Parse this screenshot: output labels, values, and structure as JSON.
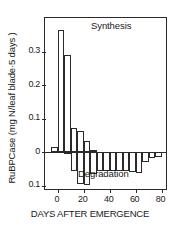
{
  "figure": {
    "background_color": "#ffffff",
    "line_color": "#2a2a2a"
  },
  "axes": {
    "ylabel": "RuBPCase (mg N/leaf blade·5 days )",
    "xlabel": "DAYS AFTER EMERGENCE",
    "ytick_labels": [
      "0.3",
      "0.2",
      "0.1",
      "0",
      "0.1"
    ],
    "ytick_values": [
      0.3,
      0.2,
      0.1,
      0,
      -0.1
    ],
    "xtick_labels": [
      "0",
      "20",
      "40",
      "60",
      "80"
    ],
    "xtick_values": [
      0,
      20,
      40,
      60,
      80
    ]
  },
  "annotations": {
    "synthesis": "Synthesis",
    "degradation": "Degradation"
  },
  "chart_data": {
    "type": "bar",
    "title": "",
    "subtitle": "",
    "xlabel": "DAYS AFTER EMERGENCE",
    "ylabel": "RuBPCase (mg N/leaf blade·5 days )",
    "xlim": [
      -10,
      85
    ],
    "ylim": [
      -0.115,
      0.4
    ],
    "grid": false,
    "legend": "none",
    "bin_width": 5,
    "zero_line": 0,
    "annotations": [
      {
        "text": "Synthesis",
        "x": 28,
        "y": 0.375
      },
      {
        "text": "Degradation",
        "x": 28,
        "y": -0.105
      }
    ],
    "series": [
      {
        "name": "Synthesis",
        "bin_starts": [
          -10,
          -5,
          0,
          5,
          10,
          15,
          20,
          25,
          30,
          35,
          40,
          45,
          50,
          55,
          60,
          65,
          70,
          75,
          80
        ],
        "values": [
          0.0,
          0.015,
          0.365,
          0.29,
          0.072,
          0.063,
          0.035,
          0.008,
          0.0,
          0.0,
          0.0,
          0.0,
          0.0,
          0.0,
          0.0,
          0.0,
          0.0,
          0.0,
          0.0
        ]
      },
      {
        "name": "Degradation",
        "bin_starts": [
          -10,
          -5,
          0,
          5,
          10,
          15,
          20,
          25,
          30,
          35,
          40,
          45,
          50,
          55,
          60,
          65,
          70,
          75,
          80
        ],
        "values": [
          0.0,
          0.0,
          0.0,
          -0.006,
          -0.055,
          -0.095,
          -0.097,
          -0.065,
          -0.055,
          -0.055,
          -0.055,
          -0.055,
          -0.055,
          -0.058,
          -0.062,
          -0.028,
          -0.016,
          -0.015,
          0.0
        ]
      }
    ]
  }
}
